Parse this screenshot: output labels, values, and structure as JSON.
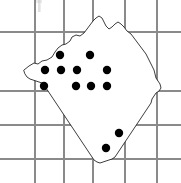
{
  "figure": {
    "kind": "distribution-map",
    "caption": "",
    "background_color": "#ffffff",
    "width": 181,
    "height": 183
  },
  "grid": {
    "visible": true,
    "line_color": "#8a8a8a",
    "line_width": 1.1,
    "vertical_x": [
      35,
      64,
      93,
      125,
      157
    ],
    "horizontal_y": [
      32,
      91,
      125,
      159
    ],
    "labels": []
  },
  "region": {
    "name": "",
    "outline_color": "#1a1a1a",
    "fill_color": "#ffffff",
    "outline_width": 0.85,
    "path": "M 24 70 L 29 66 L 34 63 L 38 64 L 42 61 L 47 60 L 52 57 L 55 52 L 58 48 L 62 45 L 66 44 L 70 41 L 72 37 L 76 35 L 80 36 L 84 33 L 87 29 L 90 25 L 93 21 L 96 18 L 99 16 L 102 18 L 104 22 L 106 26 L 109 29 L 112 27 L 115 24 L 118 22 L 121 24 L 124 27 L 127 31 L 131 34 L 134 38 L 137 42 L 140 46 L 143 50 L 146 54 L 148 58 L 150 62 L 152 66 L 154 70 L 155 74 L 156 78 L 158 81 L 160 84 L 161 88 L 159 91 L 156 93 L 154 96 L 152 99 L 151 103 L 149 106 L 147 109 L 145 112 L 143 115 L 141 118 L 139 121 L 137 124 L 135 127 L 133 130 L 131 133 L 129 136 L 127 139 L 125 142 L 123 145 L 121 148 L 119 151 L 117 154 L 115 157 L 112 159 L 109 160 L 106 161 L 103 162 L 100 163 L 97 162 L 94 160 L 92 157 L 90 154 L 88 151 L 86 148 L 84 145 L 82 142 L 80 139 L 78 136 L 76 133 L 74 130 L 72 127 L 70 124 L 68 121 L 66 118 L 64 115 L 62 112 L 60 109 L 58 106 L 56 103 L 54 100 L 52 97 L 50 94 L 48 91 L 46 88 L 44 85 L 42 83 L 39 82 L 36 81 L 33 80 L 30 79 L 27 77 L 25 74 Z"
  },
  "records": {
    "marker_shape": "filled-circle",
    "marker_color": "#000000",
    "marker_radius": 4.2,
    "count": 12,
    "points": [
      {
        "id": "r1",
        "x": 60,
        "y": 55,
        "row": 1,
        "col": 1
      },
      {
        "id": "r2",
        "x": 90,
        "y": 55,
        "row": 1,
        "col": 2
      },
      {
        "id": "r3",
        "x": 45,
        "y": 70,
        "row": 2,
        "col": 1
      },
      {
        "id": "r4",
        "x": 61,
        "y": 70,
        "row": 2,
        "col": 2
      },
      {
        "id": "r5",
        "x": 77,
        "y": 70,
        "row": 2,
        "col": 3
      },
      {
        "id": "r6",
        "x": 107,
        "y": 70,
        "row": 2,
        "col": 4
      },
      {
        "id": "r7",
        "x": 44,
        "y": 86,
        "row": 3,
        "col": 1
      },
      {
        "id": "r8",
        "x": 76,
        "y": 86,
        "row": 3,
        "col": 2
      },
      {
        "id": "r9",
        "x": 91,
        "y": 86,
        "row": 3,
        "col": 3
      },
      {
        "id": "r10",
        "x": 107,
        "y": 86,
        "row": 3,
        "col": 4
      },
      {
        "id": "r11",
        "x": 119,
        "y": 133,
        "row": 4,
        "col": 1
      },
      {
        "id": "r12",
        "x": 106,
        "y": 148,
        "row": 5,
        "col": 1
      }
    ]
  },
  "artifacts": {
    "top_smudge": {
      "x": 38,
      "y": 0,
      "width": 3,
      "height": 12
    }
  }
}
